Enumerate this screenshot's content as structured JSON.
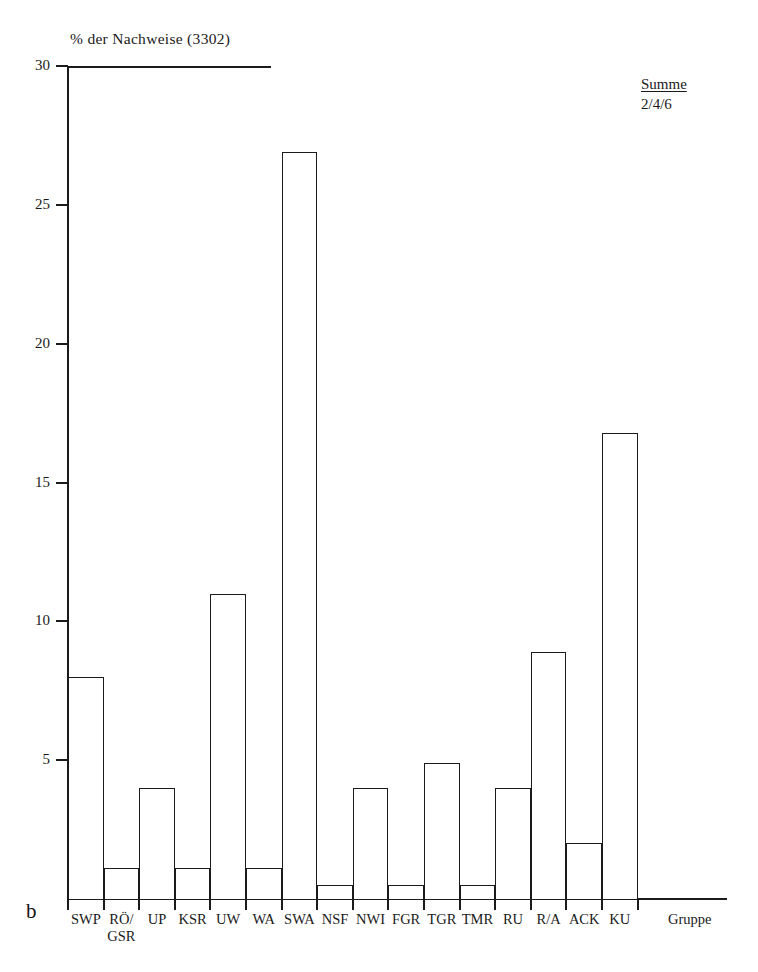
{
  "figure": {
    "panel_label": "b",
    "y_axis_title": "% der Nachweise (3302)",
    "annotation": {
      "heading": "Summe",
      "value": "2/4/6"
    }
  },
  "chart_data": {
    "type": "bar",
    "title": "% der Nachweise (3302)",
    "xlabel": "Gruppe",
    "ylabel": "% der Nachweise (3302)",
    "ylim": [
      0,
      30
    ],
    "yticks": [
      5,
      10,
      15,
      20,
      25,
      30
    ],
    "ytick_labels": [
      "5",
      "10",
      "15",
      "20",
      "25",
      "30"
    ],
    "grid": false,
    "legend": null,
    "categories": [
      "SWP",
      "RÖ/\nGSR",
      "UP",
      "KSR",
      "UW",
      "WA",
      "SWA",
      "NSF",
      "NWI",
      "FGR",
      "TGR",
      "TMR",
      "RU",
      "R/A",
      "ACK",
      "KU"
    ],
    "values": [
      8.0,
      1.1,
      4.0,
      1.1,
      11.0,
      1.1,
      26.9,
      0.5,
      4.0,
      0.5,
      4.9,
      0.5,
      4.0,
      8.9,
      2.0,
      16.8
    ],
    "annotations": [
      "Summe 2/4/6"
    ],
    "colors": {
      "bar_fill": "#ffffff",
      "bar_stroke": "#1b1b1b",
      "axis": "#1b1b1b",
      "text": "#1a1a1a"
    }
  }
}
